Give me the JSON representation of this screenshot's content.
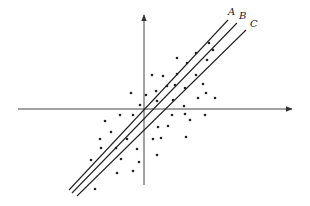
{
  "diagram": {
    "type": "scatter-with-regression-lines",
    "axes": {
      "origin": [
        144,
        109
      ],
      "x_axis": {
        "from": [
          18,
          109
        ],
        "to": [
          292,
          109
        ],
        "arrow": "right"
      },
      "y_axis": {
        "from": [
          144,
          185
        ],
        "to": [
          144,
          15
        ],
        "arrow": "up"
      }
    },
    "lines": [
      {
        "label": "A",
        "from": [
          69,
          190
        ],
        "to": [
          228,
          20
        ],
        "label_pos": [
          228,
          15
        ]
      },
      {
        "label": "B",
        "from": [
          72,
          193
        ],
        "to": [
          237,
          23
        ],
        "label_pos": [
          239,
          19
        ]
      },
      {
        "label": "C",
        "from": [
          77,
          196
        ],
        "to": [
          246,
          30
        ],
        "label_pos": [
          250,
          27
        ]
      }
    ],
    "points": [
      [
        209,
        43
      ],
      [
        213,
        50
      ],
      [
        196,
        53
      ],
      [
        207,
        60
      ],
      [
        177,
        58
      ],
      [
        187,
        63
      ],
      [
        152,
        75
      ],
      [
        163,
        76
      ],
      [
        177,
        74
      ],
      [
        196,
        75
      ],
      [
        156,
        91
      ],
      [
        167,
        86
      ],
      [
        175,
        85
      ],
      [
        185,
        88
      ],
      [
        203,
        84
      ],
      [
        131,
        93
      ],
      [
        157,
        101
      ],
      [
        173,
        100
      ],
      [
        198,
        98
      ],
      [
        215,
        98
      ],
      [
        146,
        95
      ],
      [
        206,
        93
      ],
      [
        140,
        105
      ],
      [
        184,
        106
      ],
      [
        120,
        115
      ],
      [
        133,
        115
      ],
      [
        172,
        115
      ],
      [
        185,
        114
      ],
      [
        205,
        115
      ],
      [
        105,
        121
      ],
      [
        111,
        132
      ],
      [
        158,
        127
      ],
      [
        168,
        126
      ],
      [
        190,
        120
      ],
      [
        100,
        139
      ],
      [
        127,
        139
      ],
      [
        153,
        139
      ],
      [
        161,
        138
      ],
      [
        186,
        137
      ],
      [
        101,
        148
      ],
      [
        116,
        148
      ],
      [
        137,
        149
      ],
      [
        157,
        155
      ],
      [
        91,
        160
      ],
      [
        121,
        159
      ],
      [
        139,
        162
      ],
      [
        117,
        173
      ],
      [
        133,
        171
      ],
      [
        95,
        189
      ]
    ]
  }
}
